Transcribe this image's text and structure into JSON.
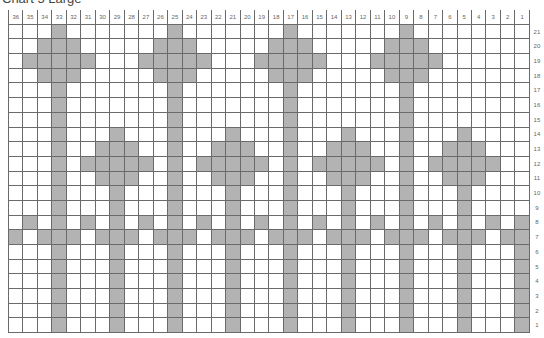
{
  "chart_data": {
    "type": "heatmap",
    "title": "Chart 5 Large",
    "columns": 36,
    "rows": 21,
    "column_labels": [
      36,
      35,
      34,
      33,
      32,
      31,
      30,
      29,
      28,
      27,
      26,
      25,
      24,
      23,
      22,
      21,
      20,
      19,
      18,
      17,
      16,
      15,
      14,
      13,
      12,
      11,
      10,
      9,
      8,
      7,
      6,
      5,
      4,
      3,
      2,
      1
    ],
    "row_labels": [
      21,
      20,
      19,
      18,
      17,
      16,
      15,
      14,
      13,
      12,
      11,
      10,
      9,
      8,
      7,
      6,
      5,
      4,
      3,
      2,
      1
    ],
    "fill_color": "#b3b3b3",
    "grid_color": "#6a6a6a",
    "shaded_by_row": {
      "21": [
        33,
        25,
        17,
        9
      ],
      "20": [
        34,
        33,
        32,
        26,
        25,
        24,
        18,
        17,
        16,
        10,
        9,
        8
      ],
      "19": [
        35,
        34,
        33,
        32,
        31,
        27,
        26,
        25,
        24,
        23,
        19,
        18,
        17,
        16,
        15,
        11,
        10,
        9,
        8,
        7
      ],
      "18": [
        34,
        33,
        32,
        26,
        25,
        24,
        18,
        17,
        16,
        10,
        9,
        8
      ],
      "17": [
        33,
        25,
        17,
        9
      ],
      "16": [
        33,
        25,
        17,
        9
      ],
      "15": [
        33,
        25,
        17,
        9
      ],
      "14": [
        33,
        29,
        25,
        21,
        17,
        13,
        9,
        5
      ],
      "13": [
        33,
        30,
        29,
        28,
        25,
        22,
        21,
        20,
        17,
        14,
        13,
        12,
        9,
        6,
        5,
        4
      ],
      "12": [
        33,
        31,
        30,
        29,
        28,
        27,
        25,
        23,
        22,
        21,
        20,
        19,
        17,
        15,
        14,
        13,
        12,
        11,
        9,
        7,
        6,
        5,
        4,
        3
      ],
      "11": [
        33,
        30,
        29,
        28,
        25,
        22,
        21,
        20,
        17,
        14,
        13,
        12,
        9,
        6,
        5,
        4
      ],
      "10": [
        33,
        29,
        25,
        21,
        17,
        13,
        9,
        5
      ],
      "9": [
        33,
        29,
        25,
        21,
        17,
        13,
        9,
        5
      ],
      "8": [
        35,
        33,
        31,
        29,
        27,
        25,
        23,
        21,
        19,
        17,
        15,
        13,
        11,
        9,
        7,
        5,
        3,
        1
      ],
      "7": [
        36,
        34,
        33,
        32,
        30,
        29,
        28,
        26,
        25,
        24,
        22,
        21,
        20,
        18,
        17,
        16,
        14,
        13,
        12,
        10,
        9,
        8,
        6,
        5,
        4,
        2,
        1
      ],
      "6": [
        33,
        29,
        25,
        21,
        17,
        13,
        9,
        5,
        1
      ],
      "5": [
        33,
        29,
        25,
        21,
        17,
        13,
        9,
        5,
        1
      ],
      "4": [
        33,
        29,
        25,
        21,
        17,
        13,
        9,
        5,
        1
      ],
      "3": [
        33,
        29,
        25,
        21,
        17,
        13,
        9,
        5,
        1
      ],
      "2": [
        33,
        29,
        25,
        21,
        17,
        13,
        9,
        5,
        1
      ],
      "1": [
        33,
        29,
        25,
        21,
        17,
        13,
        9,
        5,
        1
      ]
    },
    "legend": "none",
    "grid": true
  }
}
